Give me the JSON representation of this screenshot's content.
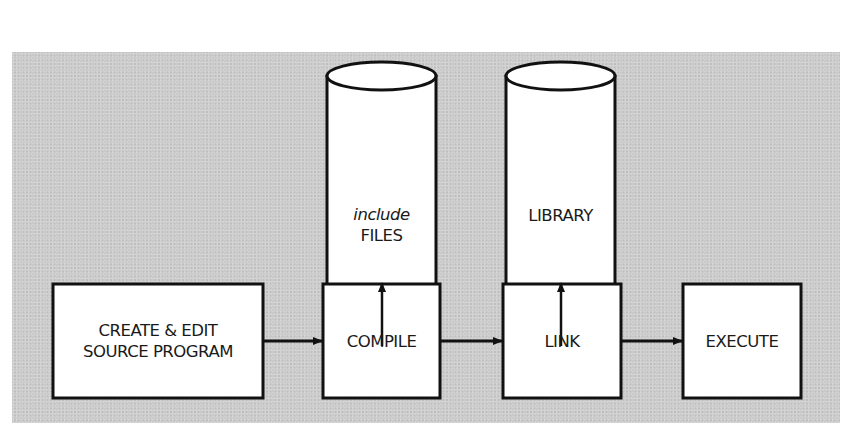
{
  "diagram": {
    "type": "flowchart",
    "background_color": "#c9c9c9",
    "stores": [
      {
        "id": "include-files",
        "line1": "include",
        "line2": "FILES",
        "line1_style": "italic",
        "feeds": "compile"
      },
      {
        "id": "library",
        "line1": "LIBRARY",
        "feeds": "link"
      }
    ],
    "steps": [
      {
        "id": "create-edit",
        "line1": "CREATE & EDIT",
        "line2": "SOURCE PROGRAM"
      },
      {
        "id": "compile",
        "line1": "COMPILE"
      },
      {
        "id": "link",
        "line1": "LINK"
      },
      {
        "id": "execute",
        "line1": "EXECUTE"
      }
    ],
    "edges": [
      {
        "from": "create-edit",
        "to": "compile"
      },
      {
        "from": "compile",
        "to": "link"
      },
      {
        "from": "link",
        "to": "execute"
      },
      {
        "from": "include-files",
        "to": "compile"
      },
      {
        "from": "library",
        "to": "link"
      }
    ]
  }
}
